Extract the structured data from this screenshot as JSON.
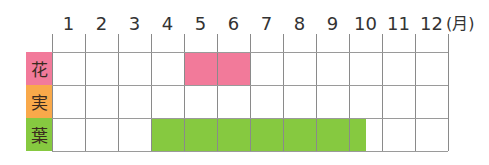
{
  "chart_data": {
    "type": "table",
    "title": "",
    "xlabel": "(月)",
    "unit_label": "(月)",
    "categories": [
      "1",
      "2",
      "3",
      "4",
      "5",
      "6",
      "7",
      "8",
      "9",
      "10",
      "11",
      "12"
    ],
    "rows": [
      {
        "label": "花",
        "color": "#f27a9a",
        "start_month": 5,
        "end_month": 6,
        "ranges": [
          [
            5.0,
            7.0
          ]
        ]
      },
      {
        "label": "実",
        "color": "#f9a94a",
        "start_month": null,
        "end_month": null,
        "ranges": []
      },
      {
        "label": "葉",
        "color": "#86c940",
        "start_month": 4,
        "end_month": 10,
        "ranges": [
          [
            4.0,
            10.5
          ]
        ]
      }
    ],
    "grid": true,
    "legend": "none"
  },
  "header": {
    "months": [
      "1",
      "2",
      "3",
      "4",
      "5",
      "6",
      "7",
      "8",
      "9",
      "10",
      "11",
      "12"
    ],
    "unit": "(月)"
  },
  "rows": [
    {
      "label": "花",
      "color": "#f27a9a"
    },
    {
      "label": "実",
      "color": "#f9a94a"
    },
    {
      "label": "葉",
      "color": "#86c940"
    }
  ]
}
